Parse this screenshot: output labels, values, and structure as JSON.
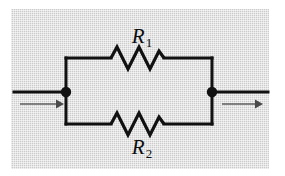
{
  "figure": {
    "background_color": "#ffffff",
    "panel_color": "#d6d6d6",
    "line_color": "#111111",
    "arrow_color": "#5e5e5e"
  },
  "labels": {
    "r1": {
      "symbol": "R",
      "subscript": "1"
    },
    "r2": {
      "symbol": "R",
      "subscript": "2"
    }
  },
  "nodes": {
    "left": {
      "name": "left-junction",
      "x": 66,
      "y": 92
    },
    "right": {
      "name": "right-junction",
      "x": 212,
      "y": 92
    }
  },
  "branches": {
    "top": {
      "label": "R1",
      "wire_y": 58,
      "resistor_x_start": 110,
      "resistor_x_end": 165
    },
    "bottom": {
      "label": "R2",
      "wire_y": 124,
      "resistor_x_start": 110,
      "resistor_x_end": 165
    }
  },
  "current_arrows": {
    "input": {
      "name": "input-current-arrow",
      "x_start": 20,
      "x_end": 62,
      "y": 104
    },
    "output": {
      "name": "output-current-arrow",
      "x_start": 222,
      "x_end": 262,
      "y": 104
    }
  },
  "leads": {
    "input_wire": {
      "x_start": 14,
      "x_end": 66,
      "y": 92
    },
    "output_wire": {
      "x_start": 212,
      "x_end": 268,
      "y": 92
    }
  }
}
